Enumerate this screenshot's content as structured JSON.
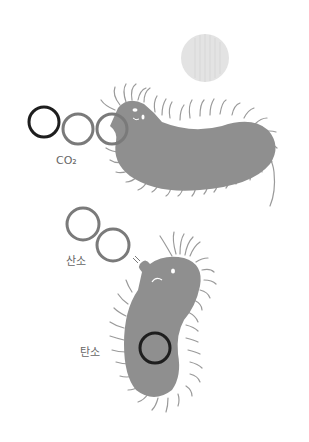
{
  "labels": {
    "co2": "CO₂",
    "oxygen": "산소",
    "carbon": "탄소"
  },
  "colors": {
    "background": "#ffffff",
    "bacteria_body": "#8f8f8f",
    "bacteria_hair": "#9a9a9a",
    "carbon_atom": "#1e1e1e",
    "oxygen_atom": "#7a7a7a",
    "light_circle": "#e2e2e2",
    "label_text": "#666666"
  },
  "elements": {
    "co2_molecule": {
      "atoms": [
        "carbon",
        "oxygen",
        "oxygen"
      ]
    },
    "o2_molecule": {
      "atoms": [
        "oxygen",
        "oxygen"
      ]
    },
    "stored_carbon": {
      "atoms": [
        "carbon"
      ]
    }
  }
}
